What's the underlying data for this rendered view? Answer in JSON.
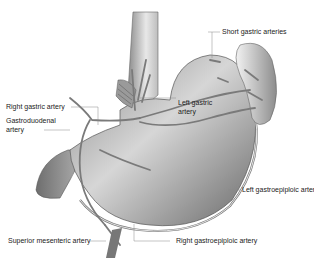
{
  "diagram": {
    "labels": {
      "short_gastric": "Short gastric arteries",
      "right_gastric": "Right gastric artery",
      "gastroduodenal_1": "Gastroduodenal",
      "gastroduodenal_2": "artery",
      "left_gastric_1": "Left gastric",
      "left_gastric_2": "artery",
      "left_gastroepiploic": "Left gastroepiploic artery",
      "superior_mesenteric": "Superior mesenteric artery",
      "right_gastroepiploic": "Right gastroepiploic artery"
    },
    "structures": [
      "esophagus",
      "stomach",
      "spleen",
      "duodenum",
      "pancreas",
      "arteries"
    ],
    "colors": {
      "organ_dark": "#6e6e6e",
      "organ_light": "#e6e6e6",
      "artery": "#7a7a7a",
      "leader_line": "#8a8a8a",
      "text": "#222222"
    }
  }
}
